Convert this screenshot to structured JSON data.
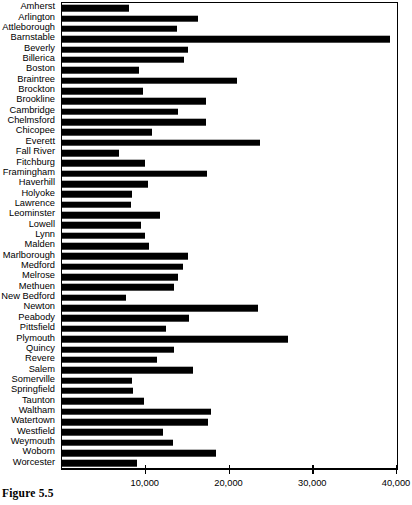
{
  "figure": {
    "caption": "Figure 5.5"
  },
  "chart_data": {
    "type": "bar",
    "orientation": "horizontal",
    "title": "",
    "xlabel": "",
    "ylabel": "",
    "xlim": [
      0,
      40000
    ],
    "grid": false,
    "legend": null,
    "xticks": [
      {
        "value": 0,
        "label": ""
      },
      {
        "value": 10000,
        "label": "10,000"
      },
      {
        "value": 20000,
        "label": "20,000"
      },
      {
        "value": 30000,
        "label": "30,000"
      },
      {
        "value": 40000,
        "label": "40,000"
      }
    ],
    "bar_color": "#000000",
    "categories": [
      "Amherst",
      "Arlington",
      "Attleborough",
      "Barnstable",
      "Beverly",
      "Billerica",
      "Boston",
      "Braintree",
      "Brockton",
      "Brookline",
      "Cambridge",
      "Chelmsford",
      "Chicopee",
      "Everett",
      "Fall River",
      "Fitchburg",
      "Framingham",
      "Haverhill",
      "Holyoke",
      "Lawrence",
      "Leominster",
      "Lowell",
      "Lynn",
      "Malden",
      "Marlborough",
      "Medford",
      "Melrose",
      "Methuen",
      "New Bedford",
      "Newton",
      "Peabody",
      "Pittsfield",
      "Plymouth",
      "Quincy",
      "Revere",
      "Salem",
      "Somerville",
      "Springfield",
      "Taunton",
      "Waltham",
      "Watertown",
      "Westfield",
      "Weymouth",
      "Woborn",
      "Worcester"
    ],
    "values": [
      8000,
      16200,
      13700,
      39200,
      15000,
      14600,
      9200,
      20900,
      9700,
      17200,
      13800,
      17200,
      10800,
      23700,
      6800,
      9900,
      17300,
      10300,
      8400,
      8200,
      11700,
      9400,
      9900,
      10400,
      15000,
      14500,
      13900,
      13400,
      7600,
      23400,
      15200,
      12400,
      27000,
      13400,
      11300,
      15700,
      8400,
      8500,
      9800,
      17800,
      17400,
      12000,
      13200,
      18400,
      8900
    ]
  }
}
